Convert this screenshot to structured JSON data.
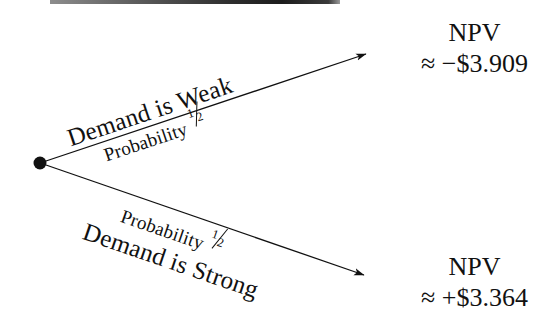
{
  "diagram": {
    "type": "decision-tree",
    "title_visible": false,
    "background_color": "#ffffff",
    "ink_color": "#111111",
    "node": {
      "label": "decision-node",
      "x": 40,
      "y": 163,
      "radius": 6.5
    },
    "branches": [
      {
        "id": "weak",
        "name": "Demand is Weak",
        "outcome_label": "Demand is Weak",
        "probability_label": "Probability",
        "probability_numerator": "1",
        "probability_denominator": "2",
        "probability_value": 0.5,
        "from": {
          "x": 40,
          "y": 163
        },
        "to": {
          "x": 372,
          "y": 52
        },
        "angle_deg": -18.5
      },
      {
        "id": "strong",
        "name": "Demand is Strong",
        "outcome_label": "Demand is Strong",
        "probability_label": "Probability",
        "probability_numerator": "1",
        "probability_denominator": "2",
        "probability_value": 0.5,
        "from": {
          "x": 40,
          "y": 163
        },
        "to": {
          "x": 370,
          "y": 277
        },
        "angle_deg": 19
      }
    ],
    "outcomes": [
      {
        "id": "weak-outcome",
        "title": "NPV",
        "value": "≈ −$3.909",
        "sign": "negative",
        "amount": -3.909
      },
      {
        "id": "strong-outcome",
        "title": "NPV",
        "value": "≈ +$3.364",
        "sign": "positive",
        "amount": 3.364
      }
    ],
    "artifact": {
      "name": "scan-bar",
      "description": "dark horizontal scan artifact at top edge"
    }
  }
}
